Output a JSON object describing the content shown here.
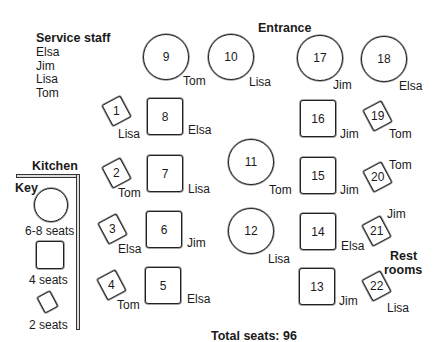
{
  "labels": {
    "service_staff_title": "Service staff",
    "entrance": "Entrance",
    "kitchen": "Kitchen",
    "key": "Key",
    "rest_rooms_line1": "Rest",
    "rest_rooms_line2": "rooms",
    "total": "Total seats: 96"
  },
  "staff": [
    "Elsa",
    "Jim",
    "Lisa",
    "Tom"
  ],
  "key": [
    {
      "shape": "round",
      "label": "6-8 seats"
    },
    {
      "shape": "square",
      "label": "4 seats"
    },
    {
      "shape": "small",
      "label": "2 seats"
    }
  ],
  "tables": [
    {
      "num": "1",
      "shape": "small",
      "server": "Lisa"
    },
    {
      "num": "2",
      "shape": "small",
      "server": "Tom"
    },
    {
      "num": "3",
      "shape": "small",
      "server": "Elsa"
    },
    {
      "num": "4",
      "shape": "small",
      "server": "Tom"
    },
    {
      "num": "5",
      "shape": "square",
      "server": "Elsa"
    },
    {
      "num": "6",
      "shape": "square",
      "server": "Jim"
    },
    {
      "num": "7",
      "shape": "square",
      "server": "Lisa"
    },
    {
      "num": "8",
      "shape": "square",
      "server": "Elsa"
    },
    {
      "num": "9",
      "shape": "round",
      "server": "Tom"
    },
    {
      "num": "10",
      "shape": "round",
      "server": "Lisa"
    },
    {
      "num": "11",
      "shape": "round",
      "server": "Tom"
    },
    {
      "num": "12",
      "shape": "round",
      "server": "Lisa"
    },
    {
      "num": "13",
      "shape": "square",
      "server": "Jim"
    },
    {
      "num": "14",
      "shape": "square",
      "server": "Elsa"
    },
    {
      "num": "15",
      "shape": "square",
      "server": "Jim"
    },
    {
      "num": "16",
      "shape": "square",
      "server": "Jim"
    },
    {
      "num": "17",
      "shape": "round",
      "server": "Jim"
    },
    {
      "num": "18",
      "shape": "round",
      "server": "Elsa"
    },
    {
      "num": "19",
      "shape": "small",
      "server": "Tom"
    },
    {
      "num": "20",
      "shape": "small",
      "server": "Tom"
    },
    {
      "num": "21",
      "shape": "small",
      "server": "Jim"
    },
    {
      "num": "22",
      "shape": "small",
      "server": "Lisa"
    }
  ]
}
